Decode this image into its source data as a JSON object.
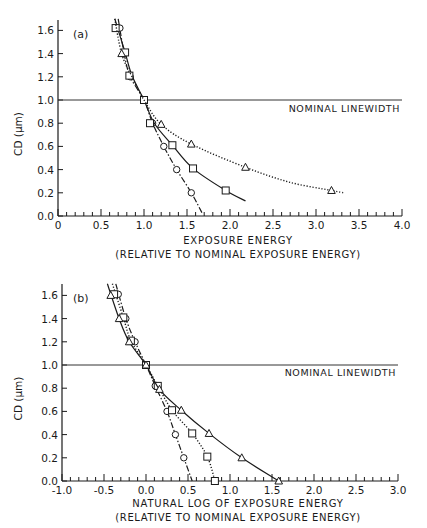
{
  "chart_data": [
    {
      "panel": "(a)",
      "type": "line",
      "xlabel": "EXPOSURE ENERGY",
      "xlabel2": "(RELATIVE TO NOMINAL EXPOSURE ENERGY)",
      "ylabel": "CD (μm)",
      "xlim": [
        0,
        4.0
      ],
      "ylim": [
        0,
        1.7
      ],
      "xticks": [
        "0",
        "0.5",
        "1.0",
        "1.5",
        "2.0",
        "2.5",
        "3.0",
        "3.5",
        "4.0"
      ],
      "xtick_values": [
        0,
        0.5,
        1.0,
        1.5,
        2.0,
        2.5,
        3.0,
        3.5,
        4.0
      ],
      "yticks": [
        "0.0",
        "0.2",
        "0.4",
        "0.6",
        "0.8",
        "1.0",
        "1.2",
        "1.4",
        "1.6"
      ],
      "ytick_values": [
        0,
        0.2,
        0.4,
        0.6,
        0.8,
        1.0,
        1.2,
        1.4,
        1.6
      ],
      "reference_line": {
        "y": 1.0,
        "label": "NOMINAL LINEWIDTH"
      },
      "series": [
        {
          "name": "circles",
          "marker": "circle",
          "line": "dashdot",
          "x": [
            0.72,
            0.77,
            0.84,
            1.0,
            1.1,
            1.23,
            1.38,
            1.55
          ],
          "y": [
            1.62,
            1.4,
            1.2,
            1.0,
            0.8,
            0.6,
            0.4,
            0.2
          ],
          "curve": [
            [
              0.7,
              1.7
            ],
            [
              0.77,
              1.4
            ],
            [
              0.84,
              1.2
            ],
            [
              1.0,
              1.0
            ],
            [
              1.1,
              0.8
            ],
            [
              1.23,
              0.6
            ],
            [
              1.38,
              0.4
            ],
            [
              1.55,
              0.2
            ],
            [
              1.68,
              0.02
            ]
          ]
        },
        {
          "name": "squares",
          "marker": "square",
          "line": "solid",
          "x": [
            0.67,
            0.78,
            0.83,
            1.0,
            1.07,
            1.33,
            1.57,
            1.95
          ],
          "y": [
            1.62,
            1.41,
            1.21,
            1.0,
            0.8,
            0.61,
            0.41,
            0.22
          ],
          "curve": [
            [
              0.66,
              1.7
            ],
            [
              0.78,
              1.41
            ],
            [
              0.86,
              1.21
            ],
            [
              1.0,
              1.0
            ],
            [
              1.12,
              0.8
            ],
            [
              1.33,
              0.61
            ],
            [
              1.57,
              0.41
            ],
            [
              1.95,
              0.22
            ],
            [
              2.18,
              0.13
            ]
          ]
        },
        {
          "name": "triangles",
          "marker": "triangle",
          "line": "dotted",
          "x": [
            0.74,
            1.2,
            1.55,
            2.18,
            3.18
          ],
          "y": [
            1.4,
            0.79,
            0.62,
            0.42,
            0.22
          ],
          "curve": [
            [
              0.66,
              1.7
            ],
            [
              0.74,
              1.4
            ],
            [
              0.86,
              1.2
            ],
            [
              1.0,
              1.0
            ],
            [
              1.2,
              0.79
            ],
            [
              1.55,
              0.62
            ],
            [
              2.18,
              0.42
            ],
            [
              2.7,
              0.29
            ],
            [
              3.18,
              0.22
            ],
            [
              3.32,
              0.2
            ]
          ]
        }
      ]
    },
    {
      "panel": "(b)",
      "type": "line",
      "xlabel": "NATURAL LOG  OF EXPOSURE ENERGY",
      "xlabel2": "(RELATIVE TO NOMINAL EXPOSURE ENERGY)",
      "ylabel": "CD (μm)",
      "xlim": [
        -1.0,
        3.0
      ],
      "ylim": [
        0,
        1.7
      ],
      "xticks": [
        "-1.0",
        "-0.5",
        "0.0",
        "0.5",
        "1.0",
        "1.5",
        "2.0",
        "2.5",
        "3.0"
      ],
      "xtick_values": [
        -1.0,
        -0.5,
        0.0,
        0.5,
        1.0,
        1.5,
        2.0,
        2.5,
        3.0
      ],
      "yticks": [
        "0.0",
        "0.2",
        "0.4",
        "0.6",
        "0.8",
        "1.0",
        "1.2",
        "1.4",
        "1.6"
      ],
      "ytick_values": [
        0,
        0.2,
        0.4,
        0.6,
        0.8,
        1.0,
        1.2,
        1.4,
        1.6
      ],
      "reference_line": {
        "y": 1.0,
        "label": "NOMINAL LINEWIDTH"
      },
      "series": [
        {
          "name": "circles",
          "marker": "circle",
          "line": "dashdot",
          "x": [
            -0.33,
            -0.24,
            -0.13,
            0.0,
            0.11,
            0.25,
            0.35,
            0.45
          ],
          "y": [
            1.61,
            1.4,
            1.2,
            1.0,
            0.82,
            0.6,
            0.4,
            0.2
          ],
          "curve": [
            [
              -0.36,
              1.7
            ],
            [
              -0.24,
              1.4
            ],
            [
              -0.13,
              1.2
            ],
            [
              0,
              1.0
            ],
            [
              0.11,
              0.82
            ],
            [
              0.25,
              0.6
            ],
            [
              0.35,
              0.4
            ],
            [
              0.45,
              0.2
            ],
            [
              0.55,
              0.0
            ]
          ]
        },
        {
          "name": "squares",
          "marker": "square",
          "line": "dotted",
          "x": [
            -0.38,
            -0.27,
            -0.18,
            0.0,
            0.14,
            0.31,
            0.55,
            0.73,
            0.82
          ],
          "y": [
            1.61,
            1.41,
            1.21,
            1.0,
            0.82,
            0.61,
            0.41,
            0.21,
            0.0
          ],
          "curve": [
            [
              -0.4,
              1.7
            ],
            [
              -0.27,
              1.41
            ],
            [
              -0.18,
              1.21
            ],
            [
              0,
              1.0
            ],
            [
              0.14,
              0.82
            ],
            [
              0.31,
              0.61
            ],
            [
              0.55,
              0.41
            ],
            [
              0.73,
              0.21
            ],
            [
              0.82,
              0.0
            ]
          ]
        },
        {
          "name": "triangles",
          "marker": "triangle",
          "line": "solid",
          "x": [
            -0.42,
            -0.32,
            -0.2,
            0.0,
            0.16,
            0.42,
            0.75,
            1.14,
            1.58
          ],
          "y": [
            1.6,
            1.4,
            1.2,
            1.0,
            0.79,
            0.61,
            0.41,
            0.2,
            0.0
          ],
          "curve": [
            [
              -0.46,
              1.7
            ],
            [
              -0.32,
              1.4
            ],
            [
              -0.2,
              1.2
            ],
            [
              0,
              1.0
            ],
            [
              0.16,
              0.79
            ],
            [
              0.42,
              0.61
            ],
            [
              0.75,
              0.41
            ],
            [
              1.14,
              0.2
            ],
            [
              1.58,
              0.0
            ]
          ]
        }
      ]
    }
  ],
  "panels": [
    {
      "label": "(a)",
      "x_title": "EXPOSURE ENERGY",
      "x_subtitle": "(RELATIVE TO NOMINAL EXPOSURE ENERGY)",
      "y_title": "CD (μm)",
      "ref_label": "NOMINAL LINEWIDTH"
    },
    {
      "label": "(b)",
      "x_title": "NATURAL LOG  OF EXPOSURE ENERGY",
      "x_subtitle": "(RELATIVE TO NOMINAL EXPOSURE ENERGY)",
      "y_title": "CD (μm)",
      "ref_label": "NOMINAL LINEWIDTH"
    }
  ]
}
